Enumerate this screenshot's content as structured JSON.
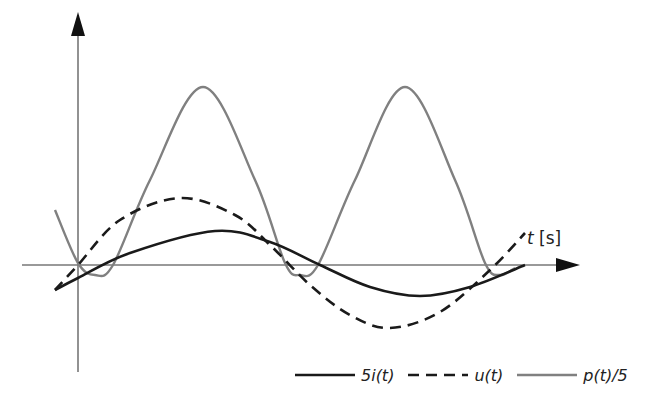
{
  "chart_data": {
    "type": "line",
    "title": "",
    "xlabel": "t [s]",
    "ylabel": "",
    "grid": false,
    "legend_position": "bottom-right",
    "ticks": {
      "x": [],
      "y": []
    },
    "series": [
      {
        "name": "5i(t)",
        "style": "solid",
        "color": "#1a1a1a",
        "description": "sinusoid lagging voltage, smaller amplitude",
        "points_px": [
          [
            55,
            290
          ],
          [
            78,
            278
          ],
          [
            130,
            253
          ],
          [
            215,
            231
          ],
          [
            270,
            242
          ],
          [
            320,
            265
          ],
          [
            370,
            287
          ],
          [
            420,
            296
          ],
          [
            470,
            287
          ],
          [
            525,
            265
          ]
        ]
      },
      {
        "name": "u(t)",
        "style": "dashed",
        "color": "#1a1a1a",
        "description": "sinusoid leading current, larger amplitude",
        "points_px": [
          [
            55,
            290
          ],
          [
            78,
            265
          ],
          [
            120,
            220
          ],
          [
            180,
            198
          ],
          [
            235,
            215
          ],
          [
            270,
            245
          ],
          [
            310,
            285
          ],
          [
            350,
            315
          ],
          [
            390,
            328
          ],
          [
            440,
            312
          ],
          [
            490,
            270
          ],
          [
            525,
            233
          ]
        ]
      },
      {
        "name": "p(t)/5",
        "style": "solid",
        "color": "#808080",
        "description": "instantaneous power, double frequency, mostly positive",
        "points_px": [
          [
            55,
            210
          ],
          [
            78,
            263
          ],
          [
            95,
            275
          ],
          [
            113,
            265
          ],
          [
            150,
            180
          ],
          [
            203,
            87
          ],
          [
            255,
            180
          ],
          [
            285,
            263
          ],
          [
            300,
            275
          ],
          [
            318,
            265
          ],
          [
            355,
            180
          ],
          [
            405,
            87
          ],
          [
            455,
            180
          ],
          [
            485,
            263
          ],
          [
            500,
            275
          ],
          [
            515,
            268
          ]
        ]
      }
    ],
    "axes": {
      "origin_px": [
        78,
        265
      ],
      "x_axis_end_px": 580,
      "y_axis_top_px": 12
    }
  },
  "labels": {
    "x_axis_var": "t",
    "x_axis_unit": "[s]"
  },
  "legend": {
    "items": [
      {
        "label": "5i(t)",
        "style": "solid",
        "color": "#1a1a1a"
      },
      {
        "label": "u(t)",
        "style": "dashed",
        "color": "#1a1a1a"
      },
      {
        "label": "p(t)/5",
        "style": "solid",
        "color": "#808080"
      }
    ]
  }
}
